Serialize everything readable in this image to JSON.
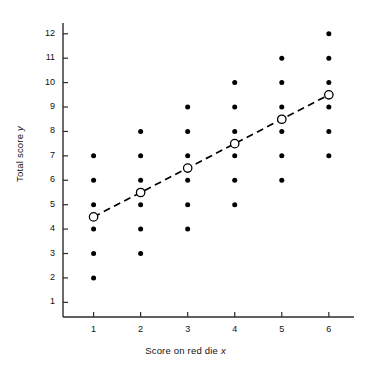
{
  "chart_data": {
    "type": "scatter",
    "title": "",
    "xlabel": "Score on red die x",
    "ylabel": "Total score y",
    "xlabel_main": "Score on red die",
    "xlabel_var": "x",
    "ylabel_main": "Total score",
    "ylabel_var": "y",
    "xlim": [
      0.35,
      6.45
    ],
    "ylim": [
      0.4,
      12.4
    ],
    "xticks": [
      1,
      2,
      3,
      4,
      5,
      6
    ],
    "yticks": [
      1,
      2,
      3,
      4,
      5,
      6,
      7,
      8,
      9,
      10,
      11,
      12
    ],
    "xtick_labels": [
      "1",
      "2",
      "3",
      "4",
      "5",
      "6"
    ],
    "ytick_labels": [
      "1",
      "2",
      "3",
      "4",
      "5",
      "6",
      "7",
      "8",
      "9",
      "10",
      "11",
      "12"
    ],
    "grid": false,
    "legend": null,
    "series": [
      {
        "name": "sample-space-points",
        "marker": "filled-circle",
        "color": "#000000",
        "points": [
          {
            "x": 1,
            "y": 2
          },
          {
            "x": 1,
            "y": 3
          },
          {
            "x": 1,
            "y": 4
          },
          {
            "x": 1,
            "y": 5
          },
          {
            "x": 1,
            "y": 6
          },
          {
            "x": 1,
            "y": 7
          },
          {
            "x": 2,
            "y": 3
          },
          {
            "x": 2,
            "y": 4
          },
          {
            "x": 2,
            "y": 5
          },
          {
            "x": 2,
            "y": 6
          },
          {
            "x": 2,
            "y": 7
          },
          {
            "x": 2,
            "y": 8
          },
          {
            "x": 3,
            "y": 4
          },
          {
            "x": 3,
            "y": 5
          },
          {
            "x": 3,
            "y": 6
          },
          {
            "x": 3,
            "y": 7
          },
          {
            "x": 3,
            "y": 8
          },
          {
            "x": 3,
            "y": 9
          },
          {
            "x": 4,
            "y": 5
          },
          {
            "x": 4,
            "y": 6
          },
          {
            "x": 4,
            "y": 7
          },
          {
            "x": 4,
            "y": 8
          },
          {
            "x": 4,
            "y": 9
          },
          {
            "x": 4,
            "y": 10
          },
          {
            "x": 5,
            "y": 6
          },
          {
            "x": 5,
            "y": 7
          },
          {
            "x": 5,
            "y": 8
          },
          {
            "x": 5,
            "y": 9
          },
          {
            "x": 5,
            "y": 10
          },
          {
            "x": 5,
            "y": 11
          },
          {
            "x": 6,
            "y": 7
          },
          {
            "x": 6,
            "y": 8
          },
          {
            "x": 6,
            "y": 9
          },
          {
            "x": 6,
            "y": 10
          },
          {
            "x": 6,
            "y": 11
          },
          {
            "x": 6,
            "y": 12
          }
        ]
      },
      {
        "name": "conditional-means",
        "marker": "open-circle",
        "color": "#000000",
        "line": "dashed",
        "points": [
          {
            "x": 1,
            "y": 4.5
          },
          {
            "x": 2,
            "y": 5.5
          },
          {
            "x": 3,
            "y": 6.5
          },
          {
            "x": 4,
            "y": 7.5
          },
          {
            "x": 5,
            "y": 8.5
          },
          {
            "x": 6,
            "y": 9.5
          }
        ]
      }
    ]
  }
}
